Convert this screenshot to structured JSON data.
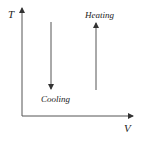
{
  "diagram": {
    "axes": {
      "y_label": "T",
      "x_label": "V"
    },
    "arrows": [
      {
        "label": "Cooling",
        "direction": "down"
      },
      {
        "label": "Heating",
        "direction": "up"
      }
    ],
    "colors": {
      "line": "#555555",
      "text": "#222222",
      "background": "#ffffff"
    }
  }
}
